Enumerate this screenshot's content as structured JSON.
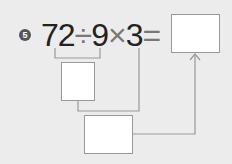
{
  "problem": {
    "number": "5",
    "expression": {
      "n1": "72",
      "op1": "÷",
      "n2": "9",
      "op2": "×",
      "n3": "3",
      "eq": "="
    },
    "answer_boxes": [
      "",
      "",
      ""
    ]
  },
  "colors": {
    "background": "#ececec",
    "line": "#999999",
    "text": "#222222"
  }
}
